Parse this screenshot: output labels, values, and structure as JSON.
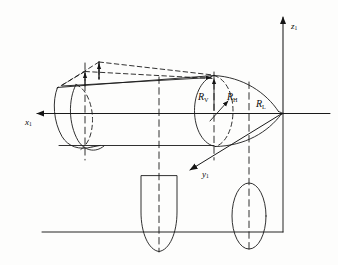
{
  "figure": {
    "type": "engineering-diagram",
    "background_color": "#fdfdfc",
    "line_color": "#1a1a1a"
  },
  "axes": {
    "x": {
      "label": "x",
      "subscript": "1",
      "direction": "left",
      "arrow": true
    },
    "y": {
      "label": "y",
      "subscript": "1",
      "direction": "down-left",
      "arrow": true
    },
    "z": {
      "label": "z",
      "subscript": "1",
      "direction": "up",
      "arrow": true
    },
    "origin_label": ""
  },
  "dimensions": [
    {
      "name": "R_V",
      "label": "R",
      "subscript": "V",
      "arrow": "vertical-up",
      "meaning": "vertical radius"
    },
    {
      "name": "R_H",
      "label": "R",
      "subscript": "H",
      "arrow": "diagonal-up-right",
      "meaning": "horizontal radius"
    },
    {
      "name": "R_L",
      "label": "R",
      "subscript": "L",
      "arrow": "none",
      "meaning": "longitudinal radius"
    }
  ],
  "elements": {
    "body": "solid-of-revolution",
    "nose_section": "ellipsoidal-nose",
    "hidden_lines": "dashed",
    "plan_projection": "u-shaped-outline",
    "section_projection": "narrow-ellipse",
    "construction_wedge": "dashed-triangular-frame"
  }
}
